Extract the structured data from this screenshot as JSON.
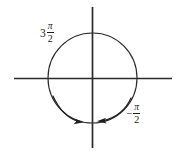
{
  "figure": {
    "kind": "unit-circle-angle-diagram",
    "background_color": "#ffffff",
    "ink_color": "#1a1a1a",
    "labels": {
      "upper_left": {
        "coefficient": "3",
        "numerator": "π",
        "denominator": "2",
        "full_text": "3π/2"
      },
      "lower_right": {
        "sign": "−",
        "numerator": "π",
        "denominator": "2",
        "full_text": "−π/2"
      }
    },
    "geometry": {
      "center_x": 92,
      "center_y": 78,
      "radius_x": 45,
      "radius_y": 45,
      "horizontal_axis": {
        "x1": 14,
        "y1": 78,
        "x2": 172,
        "y2": 78
      },
      "vertical_axis": {
        "x1": 92,
        "y1": 7,
        "x2": 92,
        "y2": 148
      }
    },
    "arrows": [
      {
        "name": "counterclockwise-arrow-left",
        "arrowhead_x": 81,
        "arrowhead_y": 121,
        "direction": "points-right-toward-vertical-axis"
      },
      {
        "name": "clockwise-arrow-right",
        "arrowhead_x": 98,
        "arrowhead_y": 120,
        "direction": "points-left-toward-vertical-axis"
      }
    ]
  }
}
